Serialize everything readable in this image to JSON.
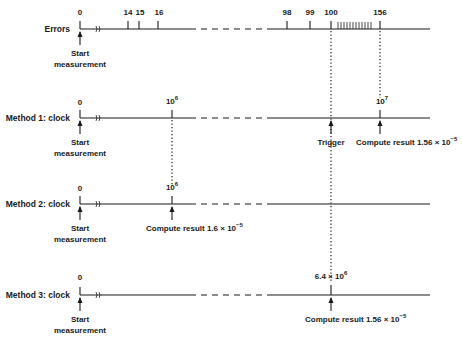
{
  "rows": [
    {
      "label": "Errors",
      "ticks": [
        "0",
        "14",
        "15",
        "16",
        "98",
        "99",
        "100",
        "156"
      ],
      "start_note": [
        "Start",
        "measurement"
      ]
    },
    {
      "label": "Method 1:  clock",
      "tick_zero": "0",
      "tick_mid_base": "10",
      "tick_mid_exp": "6",
      "tick_end_base": "10",
      "tick_end_exp": "7",
      "start_note": [
        "Start",
        "measurement"
      ],
      "trigger_label": "Trigger",
      "result_label": "Compute result 1.56 × 10",
      "result_exp": "−5"
    },
    {
      "label": "Method 2:  clock",
      "tick_zero": "0",
      "tick_mid_base": "10",
      "tick_mid_exp": "6",
      "start_note": [
        "Start",
        "measurement"
      ],
      "result_label": "Compute result 1.6 × 10",
      "result_exp": "−5"
    },
    {
      "label": "Method 3:  clock",
      "tick_zero": "0",
      "tick_mid_base": "6.4 × 10",
      "tick_mid_exp": "6",
      "start_note": [
        "Start",
        "measurement"
      ],
      "result_label": "Compute result 1.56 × 10",
      "result_exp": "−5"
    }
  ],
  "colors": {
    "ink": "#1a1a1a",
    "background": "#ffffff"
  }
}
